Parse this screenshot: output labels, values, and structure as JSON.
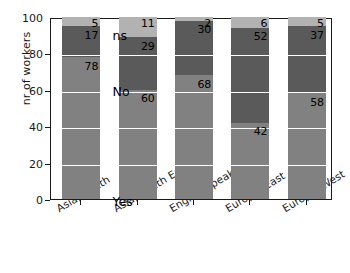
{
  "chart_data": {
    "type": "bar",
    "stacked": true,
    "title": "",
    "subtitle": "",
    "xlabel": "",
    "ylabel": "nr of workers",
    "ylim": [
      0,
      100
    ],
    "yticks": [
      0,
      20,
      40,
      60,
      80,
      100
    ],
    "grid": true,
    "grid_color": "#ffffff",
    "legend": "inline-in-bar",
    "categories": [
      "Asia, South",
      "Asia, South East",
      "English speaking",
      "Europe, East",
      "Europe, West"
    ],
    "series": [
      {
        "name": "Yes",
        "color": "#818181",
        "values": [
          78,
          60,
          68,
          42,
          58
        ]
      },
      {
        "name": "No",
        "color": "#5a5a5a",
        "values": [
          17,
          29,
          30,
          52,
          37
        ]
      },
      {
        "name": "ns",
        "color": "#b2b2b2",
        "values": [
          5,
          11,
          2,
          6,
          5
        ]
      }
    ],
    "inline_series_labels": [
      {
        "text": "ns",
        "category": "Asia, South East",
        "value_anchor": 94
      },
      {
        "text": "No",
        "category": "Asia, South East",
        "value_anchor": 63
      },
      {
        "text": "Yes",
        "category": "Asia, South East",
        "value_anchor": 3
      }
    ],
    "value_labels": {
      "Asia, South": {
        "Yes": "78",
        "No": "17",
        "ns": "5"
      },
      "Asia, South East": {
        "Yes": "60",
        "No": "29",
        "ns": "11"
      },
      "English speaking": {
        "Yes": "68",
        "No": "30",
        "ns": "2"
      },
      "Europe, East": {
        "Yes": "42",
        "No": "52",
        "ns": "6"
      },
      "Europe, West": {
        "Yes": "58",
        "No": "37",
        "ns": "5"
      }
    },
    "colors": {
      "axis": "#1a1a1a",
      "text": "#000000",
      "background": "#ffffff"
    }
  }
}
